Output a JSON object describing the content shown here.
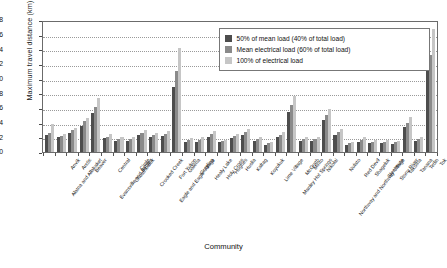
{
  "chart_data": {
    "type": "bar",
    "title": "",
    "xlabel": "Community",
    "ylabel": "Maximum travel distance (km)",
    "ylim": [
      0,
      18
    ],
    "ytick_labels": [
      "0",
      "2",
      "4",
      "6",
      "8",
      "10",
      "12",
      "14",
      "16",
      "18"
    ],
    "grid": true,
    "legend_position": "top-right",
    "categories": [
      "Alatna and Allakaket",
      "Anvik",
      "Arctic",
      "Beaver",
      "Evansville and Bettles",
      "Central",
      "Chuathbaluk",
      "Circle",
      "Crooked Creek",
      "Eagle and Eagle Village",
      "Fort Yukon",
      "Galena",
      "Grayling",
      "Healy Lake",
      "Holy Cross",
      "Hughes",
      "Huslia",
      "Kaltag",
      "Koyukuk",
      "Lime Village",
      "Manley Hot Springs",
      "McGrath",
      "Minto",
      "Nikolai",
      "Northway and Northway Village",
      "Nulato",
      "Red Devil",
      "Shageluk",
      "Sleetmute",
      "Stony River",
      "Takotna",
      "Tanana",
      "Tetlin",
      "Tok"
    ],
    "series": [
      {
        "name": "50% of mean load (40% of total load)",
        "color": "#4d4d4d",
        "values": [
          2.3,
          2.0,
          2.6,
          3.6,
          5.3,
          1.9,
          1.5,
          1.5,
          2.3,
          2.0,
          2.2,
          8.9,
          1.4,
          1.4,
          2.1,
          1.3,
          1.9,
          2.3,
          1.5,
          1.0,
          2.0,
          5.5,
          1.5,
          1.5,
          4.3,
          2.3,
          1.0,
          1.4,
          1.2,
          1.2,
          1.1,
          3.4,
          1.5,
          11.0
        ]
      },
      {
        "name": "Mean electrical load (60% of total load)",
        "color": "#8a8a8a",
        "values": [
          2.6,
          2.2,
          3.0,
          4.2,
          6.2,
          2.1,
          1.8,
          1.8,
          2.6,
          2.3,
          2.5,
          11.1,
          1.6,
          1.7,
          2.5,
          1.5,
          2.2,
          2.7,
          1.8,
          1.2,
          2.3,
          6.4,
          1.8,
          1.8,
          5.0,
          2.7,
          1.2,
          1.7,
          1.4,
          1.4,
          1.3,
          4.0,
          1.8,
          13.2
        ]
      },
      {
        "name": "100% of electrical load",
        "color": "#c6c6c6",
        "values": [
          3.8,
          2.4,
          3.3,
          4.6,
          7.3,
          2.4,
          2.0,
          2.1,
          3.0,
          2.6,
          2.8,
          14.2,
          1.9,
          2.0,
          2.9,
          1.7,
          2.5,
          3.1,
          2.1,
          1.4,
          2.7,
          7.6,
          2.1,
          2.0,
          5.9,
          3.1,
          1.4,
          2.0,
          1.6,
          1.6,
          1.5,
          4.8,
          2.1,
          16.8
        ]
      }
    ]
  },
  "legend": {
    "items": [
      {
        "label": "50% of mean load (40% of total load)"
      },
      {
        "label": "Mean electrical load (60% of total load)"
      },
      {
        "label": "100% of electrical load"
      }
    ]
  },
  "axes": {
    "y_title": "Maximum travel distance (km)",
    "x_title": "Community"
  }
}
